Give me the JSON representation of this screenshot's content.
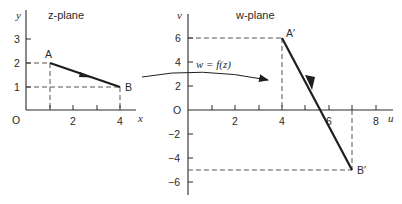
{
  "z_plane": {
    "title": "z-plane",
    "x_axis_label": "x",
    "y_axis_label": "y",
    "origin_label": "O",
    "x_tick_labels": [
      "2",
      "4"
    ],
    "y_tick_labels": [
      "1",
      "2",
      "3"
    ],
    "point_a": {
      "label": "A",
      "x": 1,
      "y": 2
    },
    "point_b": {
      "label": "B",
      "x": 4,
      "y": 1
    }
  },
  "w_plane": {
    "title": "w-plane",
    "u_axis_label": "u",
    "v_axis_label": "v",
    "origin_label": "O",
    "u_tick_labels": [
      "2",
      "4",
      "6",
      "8"
    ],
    "v_tick_labels": [
      "6",
      "4",
      "2",
      "-2",
      "-4",
      "-6"
    ],
    "point_a": {
      "label": "A′",
      "u": 4,
      "v": 6
    },
    "point_b": {
      "label": "B′",
      "u": 7,
      "v": -5
    }
  },
  "mapping": {
    "label": "w = f(z)"
  }
}
